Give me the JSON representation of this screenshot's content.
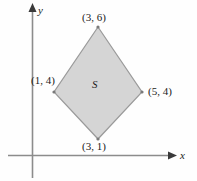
{
  "figure": {
    "background_color": "#fefefe"
  },
  "axes": {
    "x_label": "x",
    "y_label": "y",
    "axis_color": "#8c8c8c",
    "x_axis": {
      "y_px": 155,
      "x_start_px": 8,
      "x_end_px": 172
    },
    "y_axis": {
      "x_px": 32,
      "y_start_px": 5,
      "y_end_px": 178
    }
  },
  "region": {
    "name": "S",
    "fill_color": "#d5d5d5",
    "stroke_color": "#9a9a9a",
    "vertices": [
      {
        "label": "(3, 6)",
        "x": 3,
        "y": 6,
        "px": 98,
        "py": 27
      },
      {
        "label": "(5, 4)",
        "x": 5,
        "y": 4,
        "px": 142,
        "py": 92
      },
      {
        "label": "(3, 1)",
        "x": 3,
        "y": 1,
        "px": 98,
        "py": 139
      },
      {
        "label": "(1, 4)",
        "x": 1,
        "y": 4,
        "px": 54,
        "py": 92
      }
    ]
  },
  "labels": {
    "top": "(3, 6)",
    "left": "(1, 4)",
    "right": "(5, 4)",
    "bottom": "(3, 1)",
    "region": "S"
  },
  "chart_data": {
    "type": "scatter",
    "title": "",
    "xlabel": "x",
    "ylabel": "y",
    "grid": false,
    "legend": "none",
    "annotations": [
      "S"
    ],
    "polygons": [
      {
        "name": "S",
        "closed": true,
        "fill": "#d5d5d5",
        "stroke": "#9a9a9a",
        "points": [
          [
            3,
            6
          ],
          [
            5,
            4
          ],
          [
            3,
            1
          ],
          [
            1,
            4
          ]
        ],
        "point_labels": [
          "(3, 6)",
          "(5, 4)",
          "(3, 1)",
          "(1, 4)"
        ]
      }
    ],
    "xlim": [
      0,
      7
    ],
    "ylim": [
      0,
      7
    ]
  }
}
